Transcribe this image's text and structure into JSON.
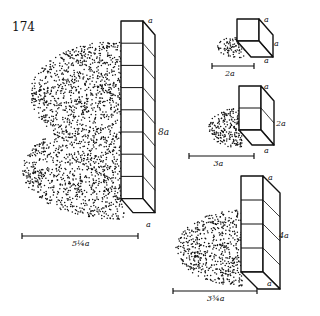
{
  "figure_number": "174",
  "colors": {
    "ink": "#111111",
    "paper": "#ffffff"
  },
  "figures": [
    {
      "id": "large",
      "height_label": "8a",
      "top_label": "a",
      "bottom_label": "a",
      "width_label": "5¼a",
      "cubes": 8
    },
    {
      "id": "small",
      "height_label": "a",
      "top_label": "a",
      "bottom_label": "a",
      "width_label": "2a",
      "cubes": 1
    },
    {
      "id": "medium",
      "height_label": "2a",
      "top_label": "a",
      "bottom_label": "a",
      "width_label": "3a",
      "cubes": 2
    },
    {
      "id": "tall",
      "height_label": "4a",
      "top_label": "a",
      "bottom_label": "a",
      "width_label": "3¾a",
      "cubes": 4
    }
  ]
}
